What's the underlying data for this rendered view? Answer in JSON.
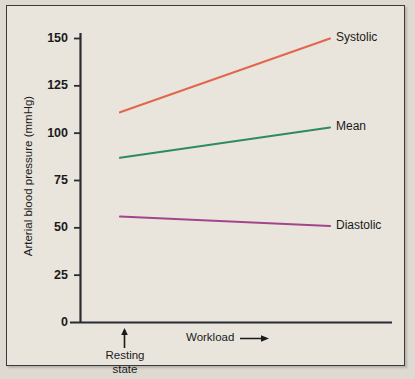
{
  "chart_data": {
    "type": "line",
    "title": "",
    "xlabel": "Workload",
    "ylabel": "Arterial blood pressure (mmHg)",
    "ylim": [
      0,
      155
    ],
    "yticks": [
      0,
      25,
      50,
      75,
      100,
      125,
      150
    ],
    "ytick_labels": [
      "0",
      "25",
      "50",
      "75",
      "100",
      "125",
      "150"
    ],
    "xlim": [
      0,
      1
    ],
    "xticks": [],
    "xtick_labels": [],
    "grid": false,
    "legend_position": "right-inline",
    "x": [
      0,
      1
    ],
    "x_point_labels": [
      "Resting state",
      "Workload"
    ],
    "series": [
      {
        "name": "Systolic",
        "values": [
          111,
          150
        ],
        "color": "#e0674c"
      },
      {
        "name": "Mean",
        "values": [
          87,
          103
        ],
        "color": "#2f8a62"
      },
      {
        "name": "Diastolic",
        "values": [
          56,
          51
        ],
        "color": "#a2458d"
      }
    ],
    "annotations": [
      {
        "name": "resting-state-marker",
        "text": "Resting\nstate",
        "arrow": "up"
      },
      {
        "name": "workload-axis-arrow",
        "text": "Workload",
        "arrow": "right"
      }
    ]
  },
  "axes": {
    "y_label": "Arterial blood pressure (mmHg)",
    "y_ticks": [
      "150",
      "125",
      "100",
      "75",
      "50",
      "25",
      "0"
    ]
  },
  "annotations": {
    "resting_line1": "Resting",
    "resting_line2": "state",
    "workload": "Workload"
  },
  "series_labels": {
    "systolic": "Systolic",
    "mean": "Mean",
    "diastolic": "Diastolic"
  },
  "colors": {
    "background": "#e9e5dd",
    "frame": "#3a3a3a",
    "axis": "#2b2b33",
    "systolic": "#e0674c",
    "mean": "#2f8a62",
    "diastolic": "#a2458d",
    "text": "#1a1a1a"
  }
}
